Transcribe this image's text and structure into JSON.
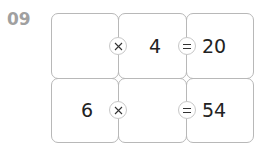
{
  "problem": {
    "number": "09",
    "rows": [
      {
        "a": "",
        "op1": "×",
        "b": "4",
        "op2": "=",
        "result": "20"
      },
      {
        "a": "6",
        "op1": "×",
        "b": "",
        "op2": "=",
        "result": "54"
      }
    ]
  },
  "colors": {
    "label": "#a0a0a0",
    "border": "#b8b8b8",
    "text": "#222222"
  }
}
